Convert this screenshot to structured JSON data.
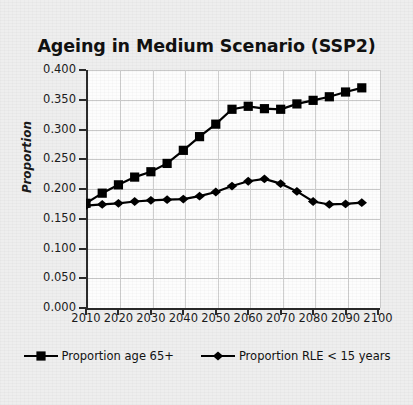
{
  "chart_data": {
    "type": "line",
    "title": "Ageing in Medium Scenario (SSP2)",
    "xlabel": "",
    "ylabel": "Proportion",
    "xlim": [
      2010,
      2100
    ],
    "ylim": [
      0.0,
      0.4
    ],
    "ytick_labels": [
      "0.400",
      "0.350",
      "0.300",
      "0.250",
      "0.200",
      "0.150",
      "0.100",
      "0.050",
      "0.000"
    ],
    "ytick_values": [
      0.4,
      0.35,
      0.3,
      0.25,
      0.2,
      0.15,
      0.1,
      0.05,
      0.0
    ],
    "xtick_labels": [
      "2010",
      "2020",
      "2030",
      "2040",
      "2050",
      "2060",
      "2070",
      "2080",
      "2090",
      "2100"
    ],
    "xtick_values": [
      2010,
      2020,
      2030,
      2040,
      2050,
      2060,
      2070,
      2080,
      2090,
      2100
    ],
    "grid": true,
    "legend_position": "bottom",
    "x": [
      2010,
      2015,
      2020,
      2025,
      2030,
      2035,
      2040,
      2045,
      2050,
      2055,
      2060,
      2065,
      2070,
      2075,
      2080,
      2085,
      2090,
      2095
    ],
    "series": [
      {
        "name": "Proportion age 65+",
        "marker": "square",
        "color": "#000000",
        "values": [
          0.176,
          0.193,
          0.207,
          0.22,
          0.229,
          0.243,
          0.265,
          0.288,
          0.309,
          0.334,
          0.339,
          0.335,
          0.334,
          0.343,
          0.349,
          0.355,
          0.363,
          0.37
        ]
      },
      {
        "name": "Proportion RLE < 15 years",
        "marker": "diamond",
        "color": "#000000",
        "values": [
          0.172,
          0.174,
          0.176,
          0.179,
          0.181,
          0.182,
          0.183,
          0.188,
          0.195,
          0.205,
          0.213,
          0.217,
          0.209,
          0.196,
          0.179,
          0.174,
          0.175,
          0.177
        ]
      }
    ]
  },
  "legend": {
    "items": [
      {
        "label": "Proportion age 65+",
        "marker": "square"
      },
      {
        "label": "Proportion RLE < 15 years",
        "marker": "diamond"
      }
    ]
  }
}
